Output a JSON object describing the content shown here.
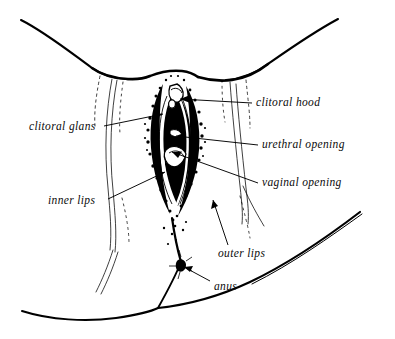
{
  "figure": {
    "type": "anatomical-line-drawing",
    "style": "black-ink line art with stippled shading on white background",
    "colors": {
      "ink": "#000000",
      "background": "#ffffff",
      "label_text": "#0b0b0b"
    },
    "canvas": {
      "width": 395,
      "height": 339
    }
  },
  "labels": [
    {
      "id": "clitoral-hood",
      "text": "clitoral hood",
      "side": "right",
      "text_x": 256,
      "text_y": 97,
      "leader": {
        "from_x": 252,
        "from_y": 103,
        "to_x": 180,
        "to_y": 99,
        "arrow": true
      }
    },
    {
      "id": "urethral-opening",
      "text": "urethral opening",
      "side": "right",
      "text_x": 262,
      "text_y": 139,
      "leader": {
        "from_x": 258,
        "from_y": 145,
        "to_x": 176,
        "to_y": 136,
        "arrow": true
      }
    },
    {
      "id": "vaginal-opening",
      "text": "vaginal opening",
      "side": "right",
      "text_x": 262,
      "text_y": 177,
      "leader": {
        "from_x": 258,
        "from_y": 183,
        "to_x": 172,
        "to_y": 152,
        "arrow": true
      }
    },
    {
      "id": "clitoral-glans",
      "text": "clitoral glans",
      "side": "left",
      "text_x": 29,
      "text_y": 121,
      "leader": {
        "from_x": 104,
        "from_y": 126,
        "to_x": 163,
        "to_y": 114,
        "arrow": true
      }
    },
    {
      "id": "inner-lips",
      "text": "inner lips",
      "side": "left",
      "text_x": 48,
      "text_y": 195,
      "leader": {
        "from_x": 108,
        "from_y": 199,
        "to_x": 165,
        "to_y": 172,
        "arrow": true
      }
    },
    {
      "id": "outer-lips",
      "text": "outer lips",
      "side": "below",
      "text_x": 218,
      "text_y": 248,
      "leader": {
        "from_x": 228,
        "from_y": 245,
        "to_x": 213,
        "to_y": 200,
        "arrow": true
      }
    },
    {
      "id": "anus",
      "text": "anus",
      "side": "below",
      "text_x": 214,
      "text_y": 281,
      "leader": {
        "from_x": 210,
        "from_y": 281,
        "to_x": 184,
        "to_y": 267,
        "arrow": true
      }
    }
  ]
}
